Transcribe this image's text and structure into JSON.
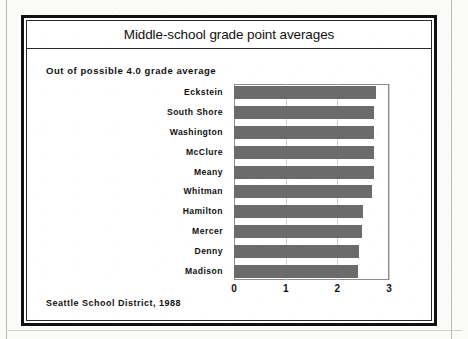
{
  "document": {
    "source_note": "Seattle School District, 1988"
  },
  "chart_panel": {
    "title": "Middle-school grade point averages",
    "subtitle": "Out of possible 4.0 grade average",
    "footnote": "Seattle School District, 1988"
  },
  "chart_data": {
    "type": "bar",
    "orientation": "horizontal",
    "title": "Middle-school grade point averages",
    "subtitle": "Out of possible 4.0 grade average",
    "xlabel": "",
    "ylabel": "",
    "xlim": [
      0,
      3
    ],
    "xticks": [
      0,
      1,
      2,
      3
    ],
    "xticklabels": [
      "0",
      "1",
      "2",
      "3"
    ],
    "grid": true,
    "grid_axis": "x",
    "legend": false,
    "bar_color": "#6b6b6b",
    "plot_border_color": "#8d8d8d",
    "categories": [
      "Eckstein",
      "South Shore",
      "Washington",
      "McClure",
      "Meany",
      "Whitman",
      "Hamilton",
      "Mercer",
      "Denny",
      "Madison"
    ],
    "values": [
      2.75,
      2.7,
      2.7,
      2.7,
      2.7,
      2.68,
      2.5,
      2.48,
      2.42,
      2.4
    ],
    "annotation": "Seattle School District, 1988"
  },
  "colors": {
    "bar": "#6b6b6b",
    "frame": "#111111",
    "text": "#101010",
    "gridline": "#cfcfcf",
    "paper": "#fbfbf9"
  }
}
